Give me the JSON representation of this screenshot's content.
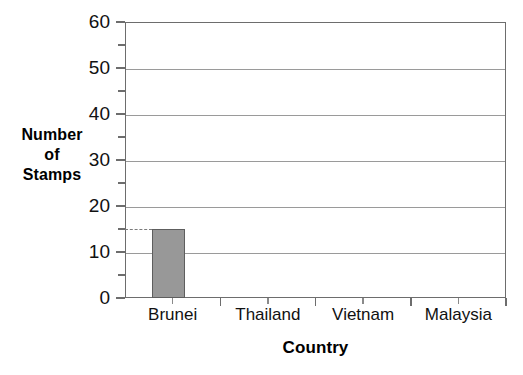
{
  "chart_data": {
    "type": "bar",
    "title": "",
    "subtitle": "",
    "xlabel": "Country",
    "ylabel": "Number of Stamps",
    "ylabel_lines": [
      "Number",
      "of",
      "Stamps"
    ],
    "categories": [
      "Brunei",
      "Thailand",
      "Vietnam",
      "Malaysia"
    ],
    "values": [
      15,
      0,
      0,
      0
    ],
    "ylim": [
      0,
      60
    ],
    "ytick_major": [
      0,
      10,
      20,
      30,
      40,
      50,
      60
    ],
    "ytick_major_labels": [
      "0",
      "10",
      "20",
      "30",
      "40",
      "50",
      "60"
    ],
    "ytick_minor": [
      5,
      15,
      25,
      35,
      45,
      55
    ],
    "grid": "horizontal-major",
    "legend": "none",
    "annotations": [
      {
        "kind": "dashed-leader",
        "value": 15,
        "from_axis": true,
        "to_category": "Brunei",
        "label": ""
      }
    ],
    "bar_fill_color": "#989898",
    "bar_edge_color": "#5e5e5e",
    "gridline_color": "#9a9a9a",
    "axis_color": "#6d6d6d"
  }
}
